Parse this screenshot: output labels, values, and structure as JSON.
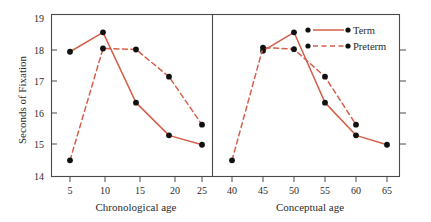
{
  "chart_data": {
    "type": "line",
    "title": "",
    "ylabel": "Seconds of Fixation",
    "ylim": [
      14,
      19
    ],
    "yticks": [
      14,
      15,
      16,
      17,
      18,
      19
    ],
    "grid": false,
    "legend_position": "top-right",
    "series_colors": {
      "term": "#d4604a",
      "preterm": "#d4604a",
      "marker": "#111111"
    },
    "legend": [
      {
        "name": "Term",
        "style": "solid"
      },
      {
        "name": "Preterm",
        "style": "dashed"
      }
    ],
    "panels": [
      {
        "xlabel": "Chronological age",
        "xticks": [
          5,
          10,
          15,
          20,
          25
        ],
        "xlim": [
          2.5,
          27.5
        ],
        "series": [
          {
            "name": "Term",
            "style": "solid",
            "x": [
              5,
              10,
              15,
              20,
              25
            ],
            "values": [
              17.85,
              18.45,
              16.28,
              15.27,
              14.98
            ]
          },
          {
            "name": "Preterm",
            "style": "dashed",
            "x": [
              5,
              10,
              15,
              20,
              25
            ],
            "values": [
              14.5,
              17.95,
              17.92,
              17.08,
              15.6
            ]
          }
        ]
      },
      {
        "xlabel": "Conceptual age",
        "xticks": [
          40,
          45,
          50,
          55,
          60,
          65
        ],
        "xlim": [
          37.5,
          67.5
        ],
        "series": [
          {
            "name": "Term",
            "style": "solid",
            "x": [
              45,
              50,
              55,
              60,
              65
            ],
            "values": [
              17.88,
              18.45,
              16.28,
              15.27,
              14.98
            ]
          },
          {
            "name": "Preterm",
            "style": "dashed",
            "x": [
              40,
              45,
              50,
              55,
              60
            ],
            "values": [
              14.5,
              17.98,
              17.93,
              17.08,
              15.6
            ]
          }
        ]
      }
    ]
  },
  "labels": {
    "ylabel": "Seconds of Fixation",
    "ytick_14": "14",
    "ytick_15": "15",
    "ytick_16": "16",
    "ytick_17": "17",
    "ytick_18": "18",
    "ytick_19": "19",
    "left_xlabel": "Chronological age",
    "left_xtick_5": "5",
    "left_xtick_10": "10",
    "left_xtick_15": "15",
    "left_xtick_20": "20",
    "left_xtick_25": "25",
    "right_xlabel": "Conceptual age",
    "right_xtick_40": "40",
    "right_xtick_45": "45",
    "right_xtick_50": "50",
    "right_xtick_55": "55",
    "right_xtick_60": "60",
    "right_xtick_65": "65",
    "legend_term": "Term",
    "legend_preterm": "Preterm"
  }
}
